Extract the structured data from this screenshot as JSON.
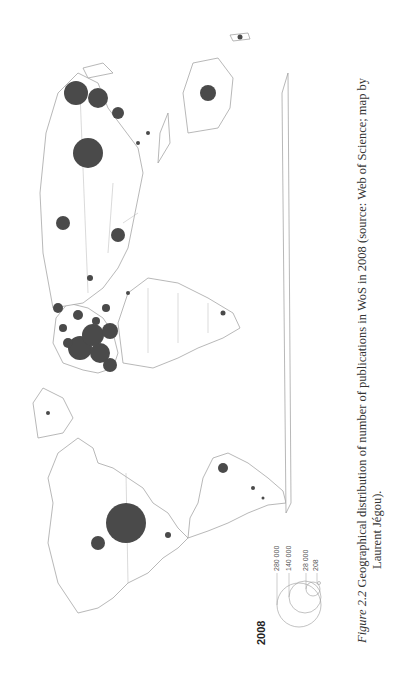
{
  "figure": {
    "number_label": "Figure 2.2",
    "caption_line1": "Geographical distribution of number of publications in WoS in 2008 (source: Web of Science; map by",
    "caption_line2": "Laurent Jégou)."
  },
  "legend": {
    "title": "2008",
    "entries": [
      {
        "label": "280 000",
        "value": 280000
      },
      {
        "label": "140 000",
        "value": 140000
      },
      {
        "label": "28 000",
        "value": 28000
      },
      {
        "label": "208",
        "value": 208
      }
    ]
  },
  "map": {
    "type": "proportional-symbol world map",
    "orientation": "rotated 90° counter-clockwise",
    "bubble_color": "#4a4a4a",
    "outline_color": "#9a9a9a",
    "regions_with_large_symbols": [
      "USA",
      "Canada",
      "Brazil",
      "Western Europe cluster",
      "China",
      "Japan",
      "India",
      "Australia",
      "Russia"
    ]
  },
  "colors": {
    "background": "#ffffff",
    "bubble": "#4a4a4a",
    "outline": "#9a9a9a"
  }
}
